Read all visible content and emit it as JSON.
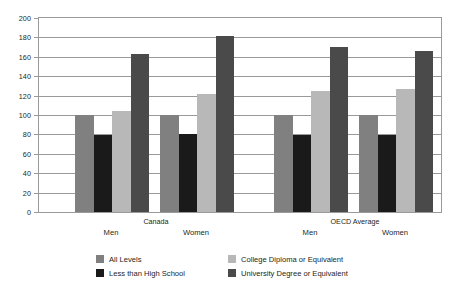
{
  "chart_data": {
    "type": "bar",
    "title": "",
    "subtitle": "",
    "xlabel": "",
    "ylabel": "",
    "ylim": [
      0,
      200
    ],
    "ytick_step": 20,
    "grid": true,
    "grid_axis": "y",
    "legend_position": "bottom",
    "yticks": [
      "0",
      "20",
      "40",
      "60",
      "80",
      "100",
      "120",
      "140",
      "160",
      "180",
      "200"
    ],
    "groups": [
      {
        "label": "Canada",
        "subgroups": [
          "Men",
          "Women"
        ]
      },
      {
        "label": "OECD Average",
        "subgroups": [
          "Men",
          "Women"
        ]
      }
    ],
    "categories": [
      "Canada Men",
      "Canada Women",
      "OECD Average Men",
      "OECD Average Women"
    ],
    "series": [
      {
        "name": "All Levels",
        "color": "#808080",
        "values": [
          100,
          100,
          100,
          100
        ]
      },
      {
        "name": "Less than High School",
        "color": "#1a1a1a",
        "values": [
          79,
          80,
          79,
          79
        ]
      },
      {
        "name": "College Diploma or Equivalent",
        "color": "#b8b8b8",
        "values": [
          104,
          122,
          125,
          127
        ]
      },
      {
        "name": "University Degree or Equivalent",
        "color": "#4a4a4a",
        "values": [
          163,
          181,
          170,
          166
        ]
      }
    ]
  },
  "legend": {
    "items": [
      {
        "label": "All Levels",
        "color": "#808080"
      },
      {
        "label": "College Diploma or Equivalent",
        "color": "#b8b8b8"
      },
      {
        "label": "Less than High School",
        "color": "#1a1a1a"
      },
      {
        "label": "University Degree or Equivalent",
        "color": "#4a4a4a"
      }
    ]
  }
}
